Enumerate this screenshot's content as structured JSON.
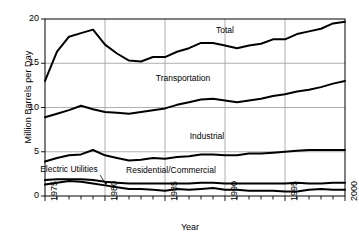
{
  "chart_data": {
    "type": "line",
    "title": "",
    "xlabel": "Year",
    "ylabel": "Million Barrels per Day",
    "xlim": [
      1975,
      2000
    ],
    "ylim": [
      0,
      20
    ],
    "yticks": [
      0,
      5,
      10,
      15,
      20
    ],
    "xticks": [
      1975,
      1980,
      1985,
      1990,
      1995,
      2000
    ],
    "xtick_labels": [
      "1975",
      "1980",
      "1985",
      "1990",
      "1995",
      "2000"
    ],
    "ytick_labels": [
      "0",
      "5",
      "10",
      "15",
      "20"
    ],
    "grid": "both-major",
    "legend": "inline-annotations",
    "x": [
      1975,
      1976,
      1977,
      1978,
      1979,
      1980,
      1981,
      1982,
      1983,
      1984,
      1985,
      1986,
      1987,
      1988,
      1989,
      1990,
      1991,
      1992,
      1993,
      1994,
      1995,
      1996,
      1997,
      1998,
      1999,
      2000
    ],
    "series": [
      {
        "name": "Total",
        "values": [
          13.0,
          16.3,
          18.0,
          18.4,
          18.8,
          17.1,
          16.1,
          15.3,
          15.2,
          15.7,
          15.7,
          16.3,
          16.7,
          17.3,
          17.3,
          17.0,
          16.7,
          17.0,
          17.2,
          17.7,
          17.7,
          18.3,
          18.6,
          18.9,
          19.5,
          19.7
        ]
      },
      {
        "name": "Transportation",
        "values": [
          8.9,
          9.3,
          9.7,
          10.2,
          9.8,
          9.5,
          9.4,
          9.3,
          9.5,
          9.7,
          9.9,
          10.3,
          10.6,
          10.9,
          11.0,
          10.8,
          10.6,
          10.8,
          11.0,
          11.3,
          11.5,
          11.8,
          12.0,
          12.3,
          12.7,
          13.0
        ]
      },
      {
        "name": "Industrial",
        "values": [
          3.9,
          4.3,
          4.6,
          4.7,
          5.2,
          4.6,
          4.3,
          4.0,
          4.1,
          4.3,
          4.2,
          4.4,
          4.5,
          4.7,
          4.7,
          4.6,
          4.6,
          4.8,
          4.8,
          4.9,
          5.0,
          5.1,
          5.2,
          5.2,
          5.2,
          5.2
        ]
      },
      {
        "name": "Residential/Commercial",
        "values": [
          1.8,
          1.9,
          1.9,
          1.9,
          1.8,
          1.6,
          1.5,
          1.4,
          1.4,
          1.4,
          1.4,
          1.4,
          1.4,
          1.5,
          1.5,
          1.4,
          1.4,
          1.4,
          1.4,
          1.4,
          1.4,
          1.5,
          1.4,
          1.4,
          1.5,
          1.5
        ]
      },
      {
        "name": "Electric Utilities",
        "values": [
          1.3,
          1.5,
          1.7,
          1.6,
          1.4,
          1.2,
          1.0,
          0.8,
          0.8,
          0.7,
          0.6,
          0.8,
          0.7,
          0.8,
          0.9,
          0.7,
          0.7,
          0.6,
          0.6,
          0.6,
          0.5,
          0.5,
          0.7,
          0.8,
          0.7,
          0.7
        ]
      }
    ],
    "annotations": [
      {
        "text": "Total",
        "x": 1990,
        "y": 18.6
      },
      {
        "text": "Transportation",
        "x": 1986.5,
        "y": 13.2
      },
      {
        "text": "Industrial",
        "x": 1988.5,
        "y": 6.7
      },
      {
        "text": "Residential/Commercial",
        "x": 1985.5,
        "y": 2.85
      },
      {
        "text": "Electric Utilities",
        "x": 1977.0,
        "y": 2.9
      }
    ],
    "line_color": "#000000",
    "grid_color": "#9a9a9a",
    "axis_color": "#000000",
    "background": "#ffffff"
  }
}
